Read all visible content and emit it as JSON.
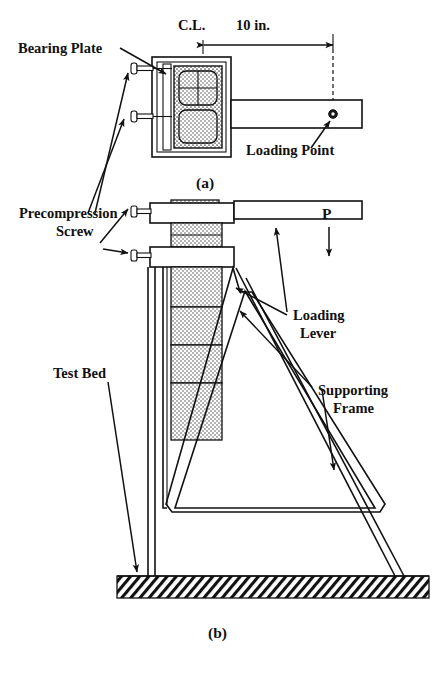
{
  "figure": {
    "panels": [
      {
        "id": "a",
        "caption": "(a)",
        "view": "top view"
      },
      {
        "id": "b",
        "caption": "(b)",
        "view": "side elevation"
      }
    ]
  },
  "panel_a": {
    "caption": "(a)",
    "labels": {
      "bearing_plate": "Bearing Plate",
      "loading_point": "Loading Point",
      "centerline": "C.L.",
      "dimension": "10 in."
    }
  },
  "panel_b": {
    "caption": "(b)",
    "labels": {
      "load": "P",
      "loading_lever": "Loading\nLever",
      "loading_lever_line1": "Loading",
      "loading_lever_line2": "Lever",
      "supporting_frame_line1": "Supporting",
      "supporting_frame_line2": "Frame",
      "test_bed": "Test Bed"
    }
  },
  "shared_labels": {
    "precompression_screw_line1": "Precompression",
    "precompression_screw_line2": "Screw"
  },
  "dimensions": {
    "lever_arm_length": "10 in.",
    "lever_arm_value": 10,
    "lever_arm_units": "in.",
    "reference": "C.L."
  },
  "colors": {
    "line": "#111111",
    "background": "#ffffff",
    "fill_stipple": "#9a9a9a",
    "loading_point": "#1a1a1a"
  }
}
